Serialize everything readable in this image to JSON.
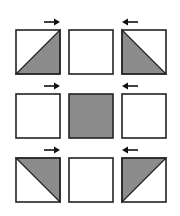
{
  "diagram": {
    "title": "",
    "colors": {
      "stroke": "#222222",
      "fill": "#8c8c8c",
      "background": "#ffffff",
      "arrow": "#111111"
    },
    "rows": [
      {
        "cells": [
          {
            "shading": "lower-right-triangle",
            "arrow": "right"
          },
          {
            "shading": "none",
            "arrow": null
          },
          {
            "shading": "lower-left-triangle",
            "arrow": "left"
          }
        ]
      },
      {
        "cells": [
          {
            "shading": "none",
            "arrow": "right"
          },
          {
            "shading": "full",
            "arrow": null
          },
          {
            "shading": "none",
            "arrow": "left"
          }
        ]
      },
      {
        "cells": [
          {
            "shading": "upper-right-triangle",
            "arrow": "right"
          },
          {
            "shading": "none",
            "arrow": null
          },
          {
            "shading": "upper-left-triangle",
            "arrow": "left"
          }
        ]
      }
    ]
  }
}
